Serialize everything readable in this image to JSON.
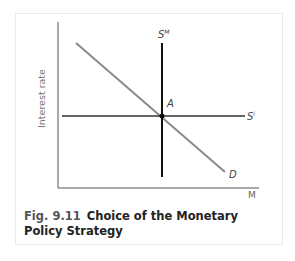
{
  "figure": {
    "number": "Fig. 9.11",
    "title": "Choice of the Monetary Policy Strategy"
  },
  "axes": {
    "y_label": "Interest rate",
    "x_label": "M"
  },
  "curves": {
    "money_supply_target": {
      "label": "S",
      "superscript": "M"
    },
    "interest_rate_target": {
      "label": "S",
      "superscript": "i"
    },
    "demand": {
      "label": "D"
    }
  },
  "points": {
    "equilibrium": {
      "label": "A"
    }
  },
  "colors": {
    "supply_lines": "#1a1a1a",
    "demand_line": "#8a8a8a",
    "axes": "#555555"
  }
}
